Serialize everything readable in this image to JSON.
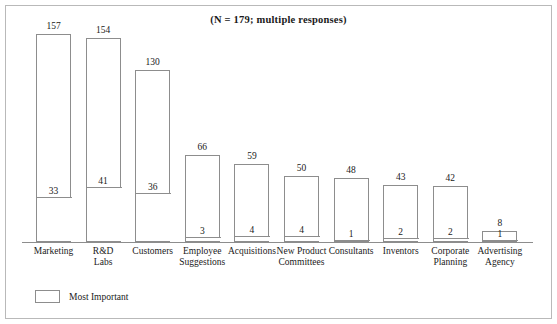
{
  "chart_data": {
    "type": "bar",
    "title": "(N = 179; multiple responses)",
    "subtitle": "",
    "xlabel": "",
    "ylabel": "",
    "ylim": [
      0,
      170
    ],
    "grid": false,
    "legend_position": "bottom-left",
    "stacked": true,
    "categories": [
      "Marketing",
      "R&D Labs",
      "Customers",
      "Employee Suggestions",
      "Acquisitions",
      "New Product Committees",
      "Consultants",
      "Inventors",
      "Corporate Planning",
      "Advertising Agency"
    ],
    "series": [
      {
        "name": "Total responses",
        "values": [
          157,
          154,
          130,
          66,
          59,
          50,
          48,
          43,
          42,
          8
        ]
      },
      {
        "name": "Most Important",
        "values": [
          33,
          41,
          36,
          3,
          4,
          4,
          1,
          2,
          2,
          1
        ]
      }
    ],
    "legend": [
      "Most Important"
    ]
  },
  "chart": {
    "title": "(N = 179; multiple responses)",
    "bars": [
      {
        "category_line1": "Marketing",
        "category_line2": "",
        "total": "157",
        "inner": "33"
      },
      {
        "category_line1": "R&D",
        "category_line2": "Labs",
        "total": "154",
        "inner": "41"
      },
      {
        "category_line1": "Customers",
        "category_line2": "",
        "total": "130",
        "inner": "36"
      },
      {
        "category_line1": "Employee",
        "category_line2": "Suggestions",
        "total": "66",
        "inner": "3"
      },
      {
        "category_line1": "Acquisitions",
        "category_line2": "",
        "total": "59",
        "inner": "4"
      },
      {
        "category_line1": "New Product",
        "category_line2": "Committees",
        "total": "50",
        "inner": "4"
      },
      {
        "category_line1": "Consultants",
        "category_line2": "",
        "total": "48",
        "inner": "1"
      },
      {
        "category_line1": "Inventors",
        "category_line2": "",
        "total": "43",
        "inner": "2"
      },
      {
        "category_line1": "Corporate",
        "category_line2": "Planning",
        "total": "42",
        "inner": "2"
      },
      {
        "category_line1": "Advertising",
        "category_line2": "Agency",
        "total": "8",
        "inner": "1"
      }
    ],
    "legend": {
      "label": "Most Important"
    },
    "colors": {
      "bar_stroke": "#8d8d8d",
      "bar_fill": "#ffffff",
      "frame": "#b9b9b9",
      "text": "#1a1a1a",
      "background": "#ffffff"
    }
  }
}
